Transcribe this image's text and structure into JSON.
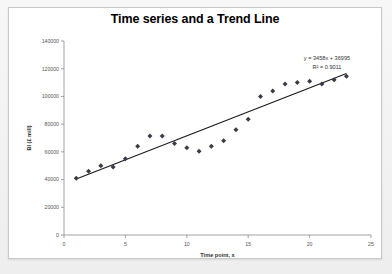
{
  "chart_data": {
    "type": "scatter",
    "title": "Time series and a Trend Line",
    "xlabel": "Time point, x",
    "ylabel": "BI (£ mill)",
    "xlim": [
      0,
      25
    ],
    "ylim": [
      0,
      140000
    ],
    "xticks": [
      "0",
      "5",
      "10",
      "15",
      "20",
      "25"
    ],
    "xtick_values": [
      0,
      5,
      10,
      15,
      20,
      25
    ],
    "yticks": [
      "0",
      "20000",
      "40000",
      "60000",
      "80000",
      "100000",
      "120000",
      "140000"
    ],
    "ytick_values": [
      0,
      20000,
      40000,
      60000,
      80000,
      100000,
      120000,
      140000
    ],
    "grid": false,
    "legend": "none",
    "marker": "diamond",
    "x": [
      1,
      2,
      3,
      4,
      5,
      6,
      7,
      8,
      9,
      10,
      11,
      12,
      13,
      14,
      15,
      16,
      17,
      18,
      19,
      20,
      21,
      22,
      23
    ],
    "values": [
      41000,
      46000,
      50000,
      49000,
      55000,
      64000,
      71500,
      71500,
      66000,
      63000,
      60500,
      64000,
      68000,
      76000,
      83500,
      100000,
      104000,
      109000,
      110000,
      111000,
      109000,
      112000,
      114500
    ],
    "series": [
      {
        "name": "BI (£ mill)",
        "values": [
          41000,
          46000,
          50000,
          49000,
          55000,
          64000,
          71500,
          71500,
          66000,
          63000,
          60500,
          64000,
          68000,
          76000,
          83500,
          100000,
          104000,
          109000,
          110000,
          111000,
          109000,
          112000,
          114500
        ]
      }
    ],
    "trendline": {
      "type": "linear",
      "slope": 3458,
      "intercept": 36995,
      "r_squared": 0.9011,
      "equation_label": "y = 3458x + 36995",
      "r2_label": "R² = 0.9011",
      "x_start": 1,
      "x_end": 23
    },
    "annotations": [
      {
        "text": "y = 3458x + 36995"
      },
      {
        "text": "R² = 0.9011"
      }
    ]
  },
  "colors": {
    "marker": "#3b3b48",
    "trendline": "#1a1a1a",
    "axis": "#8c8c8c",
    "plot_background": "#ffffff",
    "page_background": "#f2f2f2"
  }
}
